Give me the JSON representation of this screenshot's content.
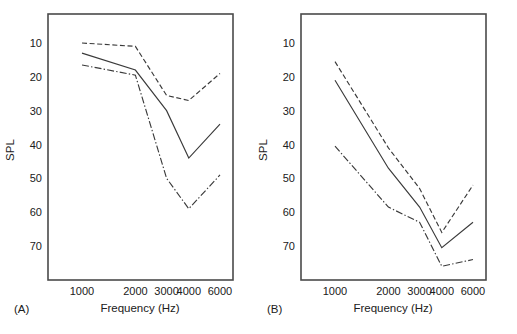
{
  "figure": {
    "title": "",
    "background": "#ffffff",
    "line_color": "#3a3a3a",
    "frame_color": "#4a4a4a"
  },
  "panels": [
    {
      "tag": "(A)",
      "name": "panel-a"
    },
    {
      "tag": "(B)",
      "name": "panel-b"
    }
  ],
  "axes": {
    "xlabel": "Frequency (Hz)",
    "ylabel": "SPL",
    "xticks": [
      "1000",
      "2000",
      "3000",
      "4000",
      "6000"
    ],
    "yticks": [
      "10",
      "20",
      "30",
      "40",
      "50",
      "60",
      "70"
    ]
  },
  "chart_data": [
    {
      "type": "line",
      "title": "(A)",
      "xlabel": "Frequency (Hz)",
      "ylabel": "SPL",
      "xscale": "log",
      "x": [
        1000,
        2000,
        3000,
        4000,
        6000
      ],
      "xticklabels": [
        "1000",
        "2000",
        "3000",
        "4000",
        "6000"
      ],
      "yticks": [
        10,
        20,
        30,
        40,
        50,
        60,
        70
      ],
      "ylim": [
        3,
        78
      ],
      "y_inverted": true,
      "grid": false,
      "legend": "none",
      "series": [
        {
          "name": "upper-dashed",
          "style": "dashed",
          "values": [
            10,
            11,
            25.5,
            27,
            19
          ]
        },
        {
          "name": "middle-solid",
          "style": "solid",
          "values": [
            13,
            18,
            30,
            44,
            34
          ]
        },
        {
          "name": "lower-dashdot",
          "style": "dashdot",
          "values": [
            16.5,
            19.5,
            50,
            59,
            49
          ]
        }
      ]
    },
    {
      "type": "line",
      "title": "(B)",
      "xlabel": "Frequency (Hz)",
      "ylabel": "SPL",
      "xscale": "log",
      "x": [
        1000,
        2000,
        3000,
        4000,
        6000
      ],
      "xticklabels": [
        "1000",
        "2000",
        "3000",
        "4000",
        "6000"
      ],
      "yticks": [
        10,
        20,
        30,
        40,
        50,
        60,
        70
      ],
      "ylim": [
        3,
        78
      ],
      "y_inverted": true,
      "grid": false,
      "legend": "none",
      "series": [
        {
          "name": "upper-dashed",
          "style": "dashed",
          "values": [
            15.5,
            41,
            53,
            66,
            52
          ]
        },
        {
          "name": "middle-solid",
          "style": "solid",
          "values": [
            21,
            47,
            58.5,
            70.5,
            63
          ]
        },
        {
          "name": "lower-dashdot",
          "style": "dashdot",
          "values": [
            40.5,
            58.5,
            63,
            76,
            74
          ]
        }
      ]
    }
  ]
}
